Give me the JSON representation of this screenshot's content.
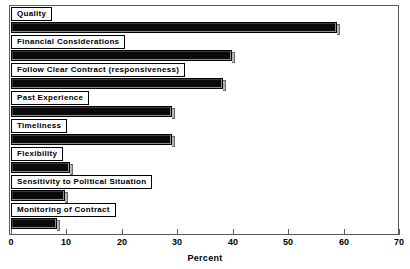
{
  "chart_data": {
    "type": "bar",
    "orientation": "horizontal",
    "title": "",
    "subtitle": "",
    "xlabel": "Percent",
    "ylabel": "",
    "xlim": [
      0,
      70
    ],
    "xticks": [
      0,
      10,
      20,
      30,
      40,
      50,
      60,
      70
    ],
    "xtick_labels": [
      "0",
      "10",
      "20",
      "30",
      "40",
      "50",
      "60",
      "70"
    ],
    "grid": false,
    "legend": null,
    "categories": [
      "Quality",
      "Financial Considerations",
      "Follow Clear Contract (responsiveness)",
      "Past Experience",
      "Timeliness",
      "Flexibility",
      "Sensitivity to Political Situation",
      "Monitoring of Contract"
    ],
    "values": [
      58.8,
      39.9,
      38.3,
      29.1,
      29.0,
      10.6,
      9.7,
      8.3
    ],
    "bar_color": "#0a0a0a",
    "frame_color": "#5a5a5a"
  }
}
